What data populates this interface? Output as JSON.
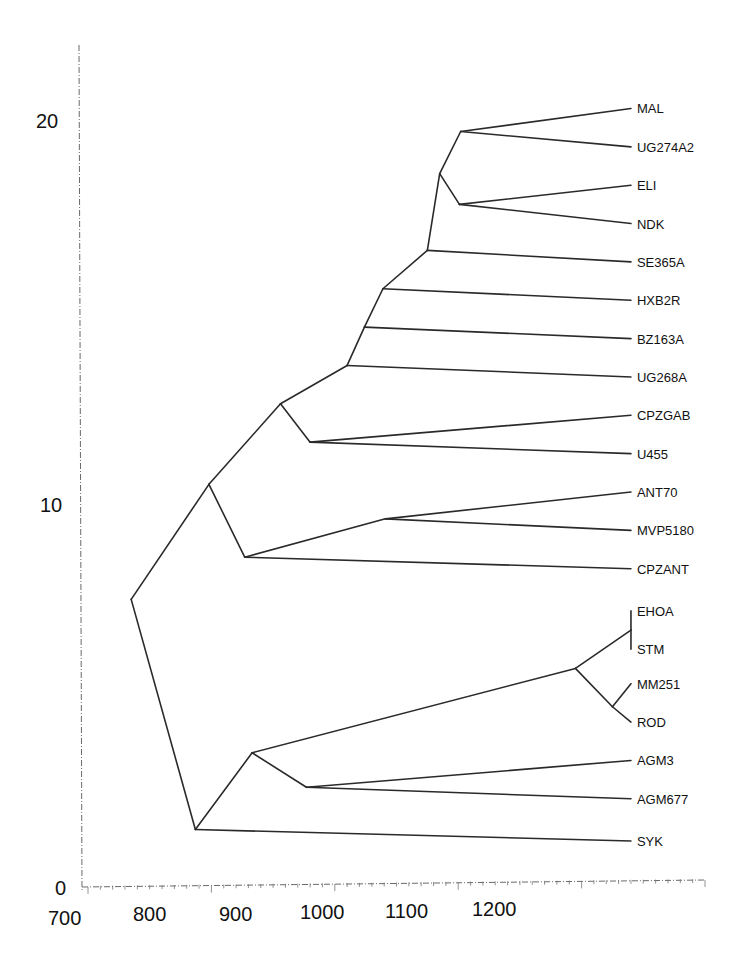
{
  "chart_data": {
    "type": "dendrogram",
    "title": "",
    "xlabel": "",
    "ylabel": "",
    "x_axis": {
      "ticks": [
        700,
        800,
        900,
        1000,
        1100,
        1200
      ],
      "range": [
        700,
        1200
      ]
    },
    "y_axis": {
      "ticks": [
        0,
        10,
        20
      ],
      "range": [
        0,
        22
      ]
    },
    "grid": false,
    "leaves": [
      {
        "name": "MAL",
        "x": 1140,
        "y": 20.3
      },
      {
        "name": "UG274A2",
        "x": 1140,
        "y": 19.3
      },
      {
        "name": "ELI",
        "x": 1140,
        "y": 18.3
      },
      {
        "name": "NDK",
        "x": 1140,
        "y": 17.3
      },
      {
        "name": "SE365A",
        "x": 1140,
        "y": 16.3
      },
      {
        "name": "HXB2R",
        "x": 1140,
        "y": 15.3
      },
      {
        "name": "BZ163A",
        "x": 1140,
        "y": 14.3
      },
      {
        "name": "UG268A",
        "x": 1140,
        "y": 13.3
      },
      {
        "name": "CPZGAB",
        "x": 1140,
        "y": 12.3
      },
      {
        "name": "U455",
        "x": 1140,
        "y": 11.3
      },
      {
        "name": "ANT70",
        "x": 1140,
        "y": 10.3
      },
      {
        "name": "MVP5180",
        "x": 1140,
        "y": 9.3
      },
      {
        "name": "CPZANT",
        "x": 1140,
        "y": 8.3
      },
      {
        "name": "EHOA",
        "x": 1140,
        "y": 7.2
      },
      {
        "name": "STM",
        "x": 1140,
        "y": 6.2
      },
      {
        "name": "MM251",
        "x": 1140,
        "y": 5.3
      },
      {
        "name": "ROD",
        "x": 1140,
        "y": 4.3
      },
      {
        "name": "AGM3",
        "x": 1140,
        "y": 3.3
      },
      {
        "name": "AGM677",
        "x": 1140,
        "y": 2.3
      },
      {
        "name": "SYK",
        "x": 1140,
        "y": 1.2
      }
    ],
    "nodes": [
      {
        "id": "n_mal_ug274",
        "x": 1002,
        "y": 19.7,
        "children": [
          "MAL",
          "UG274A2"
        ]
      },
      {
        "id": "n_eli_ndk",
        "x": 1001,
        "y": 17.8,
        "children": [
          "ELI",
          "NDK"
        ]
      },
      {
        "id": "n_top4",
        "x": 985,
        "y": 18.6,
        "children": [
          "n_mal_ug274",
          "n_eli_ndk"
        ]
      },
      {
        "id": "n_se365",
        "x": 975,
        "y": 16.6,
        "children": [
          "n_top4",
          "SE365A"
        ]
      },
      {
        "id": "n_hxb2",
        "x": 939,
        "y": 15.6,
        "children": [
          "n_se365",
          "HXB2R"
        ]
      },
      {
        "id": "n_bz163",
        "x": 924,
        "y": 14.6,
        "children": [
          "n_hxb2",
          "BZ163A"
        ]
      },
      {
        "id": "n_ug268",
        "x": 910,
        "y": 13.6,
        "children": [
          "n_bz163",
          "UG268A"
        ]
      },
      {
        "id": "n_cpzgab_u455",
        "x": 880,
        "y": 11.6,
        "children": [
          "CPZGAB",
          "U455"
        ]
      },
      {
        "id": "n_hiv1_cpz",
        "x": 856,
        "y": 12.6,
        "children": [
          "n_ug268",
          "n_cpzgab_u455"
        ]
      },
      {
        "id": "n_ant70_mvp",
        "x": 941,
        "y": 9.6,
        "children": [
          "ANT70",
          "MVP5180"
        ]
      },
      {
        "id": "n_cpzant",
        "x": 827,
        "y": 8.6,
        "children": [
          "n_ant70_mvp",
          "CPZANT"
        ]
      },
      {
        "id": "n_hiv1_all",
        "x": 798,
        "y": 10.5,
        "children": [
          "n_hiv1_cpz",
          "n_cpzant"
        ]
      },
      {
        "id": "n_ehoa_stm",
        "x": 1140,
        "y": 6.7,
        "children": [
          "EHOA",
          "STM"
        ]
      },
      {
        "id": "n_mm251_rod",
        "x": 1125,
        "y": 4.7,
        "children": [
          "MM251",
          "ROD"
        ]
      },
      {
        "id": "n_hiv2",
        "x": 1095,
        "y": 5.7,
        "children": [
          "n_ehoa_stm",
          "n_mm251_rod"
        ]
      },
      {
        "id": "n_agm",
        "x": 877,
        "y": 2.6,
        "children": [
          "AGM3",
          "AGM677"
        ]
      },
      {
        "id": "n_hiv2_agm",
        "x": 833,
        "y": 3.5,
        "children": [
          "n_hiv2",
          "n_agm"
        ]
      },
      {
        "id": "n_syk",
        "x": 787,
        "y": 1.5,
        "children": [
          "n_hiv2_agm",
          "SYK"
        ]
      },
      {
        "id": "root",
        "x": 735,
        "y": 7.5,
        "children": [
          "n_hiv1_all",
          "n_syk"
        ]
      }
    ]
  },
  "axes": {
    "x_ticks": [
      "700",
      "800",
      "900",
      "1000",
      "1100",
      "1200"
    ],
    "y_ticks": [
      "0",
      "10",
      "20"
    ]
  },
  "colors": {
    "line": "#2a2a2a",
    "axis": "#6a6a6a",
    "background": "#ffffff"
  }
}
